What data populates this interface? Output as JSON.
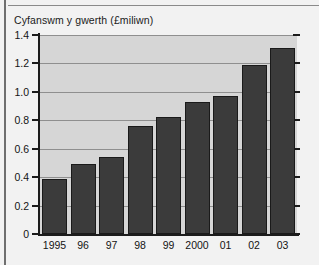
{
  "chart_data": {
    "type": "bar",
    "title": "Cyfanswm y gwerth (£miliwn)",
    "xlabel": "",
    "ylabel": "",
    "categories": [
      "1995",
      "96",
      "97",
      "98",
      "99",
      "2000",
      "01",
      "02",
      "03"
    ],
    "values": [
      0.39,
      0.49,
      0.54,
      0.76,
      0.82,
      0.93,
      0.97,
      1.19,
      1.31
    ],
    "ylim": [
      0,
      1.4
    ],
    "yticks": [
      "0",
      "0.2",
      "0.4",
      "0.6",
      "0.8",
      "1.0",
      "1.2",
      "1.4"
    ],
    "ytick_values": [
      0,
      0.2,
      0.4,
      0.6,
      0.8,
      1.0,
      1.2,
      1.4
    ],
    "grid": true,
    "legend": null,
    "bar_color": "#3b3b3b",
    "plot_background": "#d6d6d6",
    "page_background": "#f2f2f2"
  }
}
